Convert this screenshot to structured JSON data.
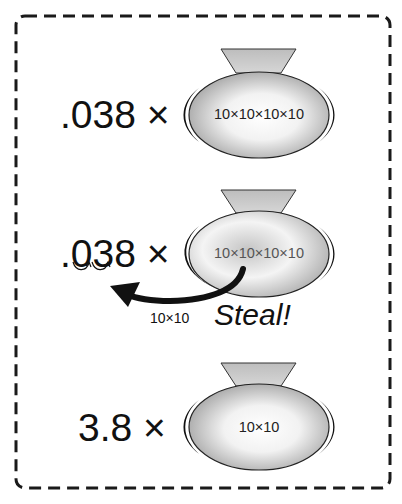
{
  "diagram": {
    "title": "",
    "rows": [
      {
        "label": ".038 ×",
        "bag_contents": "10×10×10×10"
      },
      {
        "label": ".038 ×",
        "bag_contents": "10×10×10×10",
        "arrow_label": "10×10",
        "action": "Steal!"
      },
      {
        "label": "3.8 ×",
        "bag_contents": "10×10"
      }
    ],
    "colors": {
      "border": "#1a1a1a",
      "bag_neck": "#c8c8c8",
      "bag_body_light": "#ffffff",
      "bag_body_dark": "#9a9a9a",
      "bag_outline": "#111111",
      "arrow": "#111111"
    }
  }
}
